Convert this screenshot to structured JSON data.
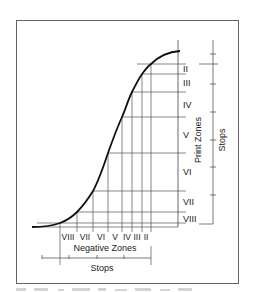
{
  "figure": {
    "print_zones_label": "Print Zones",
    "negative_zones_label": "Negative Zones",
    "stops_right_label": "Stops",
    "stops_bottom_label": "Stops",
    "print_zones": [
      "II",
      "III",
      "IV",
      "V",
      "VI",
      "VII",
      "VIII"
    ],
    "negative_zones": [
      "VIII",
      "VII",
      "VI",
      "V",
      "IV",
      "III",
      "II"
    ],
    "curve_points": [
      [
        32,
        227
      ],
      [
        45,
        226
      ],
      [
        60,
        223
      ],
      [
        77,
        212
      ],
      [
        93,
        191
      ],
      [
        108,
        153
      ],
      [
        122,
        117
      ],
      [
        132,
        92
      ],
      [
        142,
        74
      ],
      [
        151,
        64
      ],
      [
        165,
        55
      ],
      [
        180,
        51
      ]
    ],
    "colors": {
      "line": "#222222",
      "grid": "#555555",
      "frame": "#666666",
      "caption": "#cfcfcf"
    }
  }
}
